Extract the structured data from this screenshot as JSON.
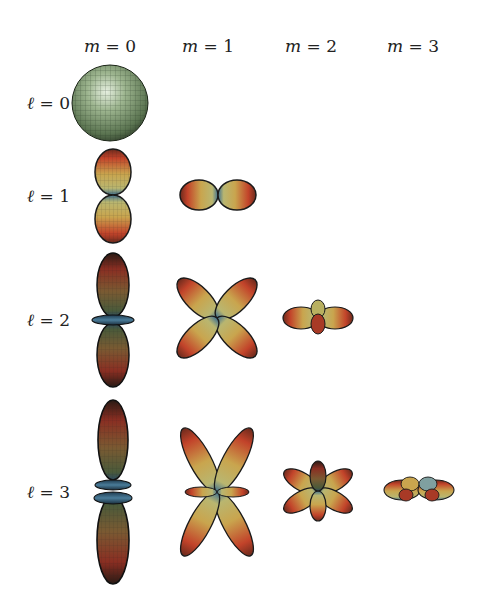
{
  "diagram": {
    "column_headers": [
      {
        "var": "m",
        "eq": " = 0",
        "x": 110
      },
      {
        "var": "m",
        "eq": " = 1",
        "x": 208
      },
      {
        "var": "m",
        "eq": " = 2",
        "x": 311
      },
      {
        "var": "m",
        "eq": " = 3",
        "x": 413
      }
    ],
    "row_headers": [
      {
        "var": "ℓ",
        "eq": " = 0",
        "y": 103
      },
      {
        "var": "ℓ",
        "eq": " = 1",
        "y": 196
      },
      {
        "var": "ℓ",
        "eq": " = 2",
        "y": 320
      },
      {
        "var": "ℓ",
        "eq": " = 3",
        "y": 492
      }
    ],
    "shapes": [
      {
        "l": 0,
        "m": 0,
        "description": "green sphere"
      },
      {
        "l": 1,
        "m": 0,
        "description": "two vertical lobes"
      },
      {
        "l": 1,
        "m": 1,
        "description": "two horizontal lobes"
      },
      {
        "l": 2,
        "m": 0,
        "description": "two vertical lobes with equatorial torus"
      },
      {
        "l": 2,
        "m": 1,
        "description": "four diagonal lobes (X shape)"
      },
      {
        "l": 2,
        "m": 2,
        "description": "four-lobed flattened cluster"
      },
      {
        "l": 3,
        "m": 0,
        "description": "two long vertical lobes with two tori"
      },
      {
        "l": 3,
        "m": 1,
        "description": "six lobes: four diagonal plus two horizontal"
      },
      {
        "l": 3,
        "m": 2,
        "description": "six-lobed flower"
      },
      {
        "l": 3,
        "m": 3,
        "description": "flattened multi-lobed cluster"
      }
    ],
    "colors": {
      "sphere": "#7d9a72",
      "lobe_red": "#c2432a",
      "lobe_yellow": "#c9b25a",
      "lobe_blue": "#4a7c99",
      "outline": "#1a1a1a"
    }
  }
}
